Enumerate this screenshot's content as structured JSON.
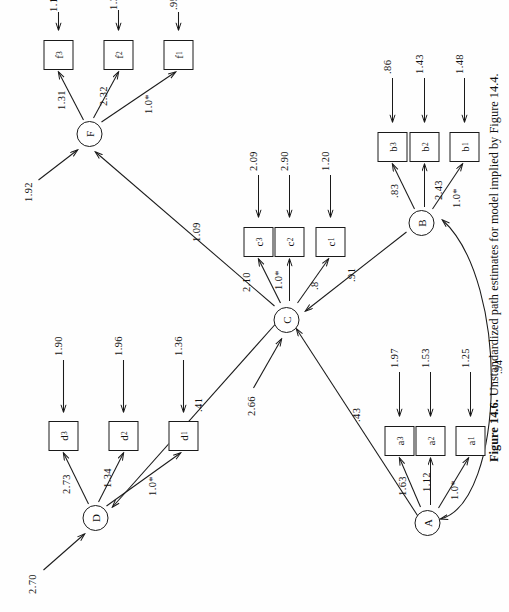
{
  "caption": {
    "prefix": "Figure 14.6.",
    "text": " Unstandardized path estimates for model implied by Figure 14.4."
  },
  "factors": [
    {
      "id": "D",
      "label": "D"
    },
    {
      "id": "F",
      "label": "F"
    },
    {
      "id": "C",
      "label": "C"
    },
    {
      "id": "A",
      "label": "A"
    },
    {
      "id": "B",
      "label": "B"
    }
  ],
  "indicators": [
    {
      "id": "d1",
      "letter": "d",
      "sub": "1"
    },
    {
      "id": "d2",
      "letter": "d",
      "sub": "2"
    },
    {
      "id": "d3",
      "letter": "d",
      "sub": "3"
    },
    {
      "id": "f1",
      "letter": "f",
      "sub": "1"
    },
    {
      "id": "f2",
      "letter": "f",
      "sub": "2"
    },
    {
      "id": "f3",
      "letter": "f",
      "sub": "3"
    },
    {
      "id": "c1",
      "letter": "c",
      "sub": "1"
    },
    {
      "id": "c2",
      "letter": "c",
      "sub": "2"
    },
    {
      "id": "c3",
      "letter": "c",
      "sub": "3"
    },
    {
      "id": "a1",
      "letter": "a",
      "sub": "1"
    },
    {
      "id": "a2",
      "letter": "a",
      "sub": "2"
    },
    {
      "id": "a3",
      "letter": "a",
      "sub": "3"
    },
    {
      "id": "b1",
      "letter": "b",
      "sub": "1"
    },
    {
      "id": "b2",
      "letter": "b",
      "sub": "2"
    },
    {
      "id": "b3",
      "letter": "b",
      "sub": "3"
    }
  ],
  "loadings": {
    "D_d3": "2.73",
    "D_d2": "1.34",
    "D_d1": "1.0*",
    "F_f3": "1.31",
    "F_f2": "2.32",
    "F_f1": "1.0*",
    "C_c3": "2.10",
    "C_c2": "1.0*",
    "C_c1": ".8",
    "A_a3": "1.63",
    "A_a2": "1.12",
    "A_a1": "1.0*",
    "B_b3": ".83",
    "B_b2": "2.43",
    "B_b1": "1.0*"
  },
  "structural": {
    "C_D": ".41",
    "C_F": "1.09",
    "A_C": ".43",
    "B_C": ".91",
    "A_B_covariance": ".94"
  },
  "disturbances": {
    "D": "2.70",
    "F": "1.92",
    "C": "2.66"
  },
  "errors": {
    "d1": "1.36",
    "d2": "1.96",
    "d3": "1.90",
    "f1": ".95",
    "f2": "1.39",
    "f3": "1.18",
    "c1": "1.20",
    "c2": "2.90",
    "c3": "2.09",
    "a1": "1.25",
    "a2": "1.53",
    "a3": "1.97",
    "b1": "1.48",
    "b2": "1.43",
    "b3": ".86"
  },
  "colors": {
    "ink": "#1a1a1a",
    "paper": "#fefefe"
  }
}
